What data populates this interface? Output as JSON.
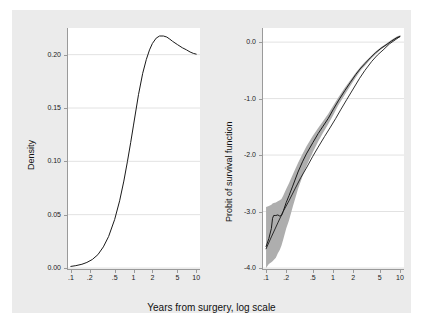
{
  "figure": {
    "background_color": "#ebebeb",
    "plot_background_color": "#ffffff",
    "axis_color": "#9a9a9a",
    "line_color": "#1a1a1a",
    "ci_band_color": "#aeaeae",
    "shared_xlabel": "Years from surgery, log scale"
  },
  "chart_data": [
    {
      "type": "line",
      "panel": "left",
      "title": "",
      "xlabel": "Years from surgery, log scale",
      "ylabel": "Density",
      "xscale": "log",
      "xlim": [
        0.09,
        11.5
      ],
      "ylim": [
        0.0,
        0.225
      ],
      "xticks": [
        0.1,
        0.2,
        0.5,
        1,
        2,
        5,
        10
      ],
      "xticklabels": [
        ".1",
        ".2",
        ".5",
        "1",
        "2",
        "5",
        "10"
      ],
      "yticks": [
        0.0,
        0.05,
        0.1,
        0.15,
        0.2
      ],
      "yticklabels": [
        "0.00",
        "0.05",
        "0.10",
        "0.15",
        "0.20"
      ],
      "grid": "horizontal",
      "legend": "none",
      "series": [
        {
          "name": "Density of log time from surgery",
          "x": [
            0.1,
            0.12,
            0.15,
            0.18,
            0.22,
            0.27,
            0.33,
            0.4,
            0.5,
            0.6,
            0.7,
            0.8,
            0.9,
            1.0,
            1.2,
            1.4,
            1.6,
            1.8,
            2.0,
            2.3,
            2.6,
            3.0,
            3.4,
            3.8,
            4.2,
            5.0,
            6.0,
            7.0,
            8.0,
            9.0,
            10.0
          ],
          "y": [
            0.0015,
            0.0022,
            0.0035,
            0.0052,
            0.008,
            0.0125,
            0.0198,
            0.0295,
            0.0455,
            0.063,
            0.0815,
            0.1,
            0.1175,
            0.134,
            0.1625,
            0.1825,
            0.1955,
            0.2045,
            0.2105,
            0.2155,
            0.2175,
            0.2175,
            0.2165,
            0.2145,
            0.2125,
            0.2095,
            0.2065,
            0.2045,
            0.2025,
            0.2012,
            0.2005
          ]
        }
      ]
    },
    {
      "type": "line",
      "panel": "right",
      "title": "",
      "xlabel": "Years from surgery, log scale",
      "ylabel": "Probit of survival function",
      "xscale": "log",
      "xlim": [
        0.09,
        11.5
      ],
      "ylim": [
        -4.0,
        0.25
      ],
      "xticks": [
        0.1,
        0.2,
        0.5,
        1,
        2,
        5,
        10
      ],
      "xticklabels": [
        ".1",
        ".2",
        ".5",
        "1",
        "2",
        "5",
        "10"
      ],
      "yticks": [
        0.0,
        -1.0,
        -2.0,
        -3.0,
        -4.0
      ],
      "yticklabels": [
        "0.0",
        "-1.0",
        "-2.0",
        "-3.0",
        "-4.0"
      ],
      "grid": "horizontal",
      "legend": "none",
      "series": [
        {
          "name": "Probit of empirical survival function",
          "style": "step",
          "x": [
            0.1,
            0.11,
            0.12,
            0.125,
            0.13,
            0.14,
            0.15,
            0.16,
            0.17,
            0.18,
            0.2,
            0.22,
            0.25,
            0.3,
            0.35,
            0.4,
            0.5,
            0.6,
            0.7,
            0.85,
            1.0,
            1.2,
            1.5,
            1.8,
            2.2,
            2.6,
            3.0,
            3.6,
            4.3,
            5.2,
            6.2,
            7.5,
            9.0,
            10.0
          ],
          "y": [
            -3.62,
            -3.48,
            -3.3,
            -3.12,
            -3.07,
            -3.07,
            -3.06,
            -3.08,
            -3.07,
            -3.0,
            -2.84,
            -2.72,
            -2.55,
            -2.3,
            -2.12,
            -1.98,
            -1.78,
            -1.62,
            -1.5,
            -1.35,
            -1.2,
            -1.04,
            -0.86,
            -0.72,
            -0.57,
            -0.46,
            -0.38,
            -0.28,
            -0.19,
            -0.11,
            -0.05,
            0.02,
            0.08,
            0.1
          ]
        },
        {
          "name": "Fitted probit line",
          "style": "smooth",
          "x": [
            0.1,
            0.12,
            0.15,
            0.18,
            0.22,
            0.27,
            0.33,
            0.4,
            0.5,
            0.6,
            0.75,
            0.9,
            1.1,
            1.3,
            1.6,
            2.0,
            2.5,
            3.0,
            3.8,
            4.6,
            5.6,
            7.0,
            8.5,
            10.0
          ],
          "y": [
            -3.66,
            -3.45,
            -3.2,
            -3.0,
            -2.81,
            -2.6,
            -2.4,
            -2.23,
            -2.02,
            -1.86,
            -1.67,
            -1.52,
            -1.35,
            -1.2,
            -1.02,
            -0.83,
            -0.64,
            -0.5,
            -0.34,
            -0.23,
            -0.14,
            -0.03,
            0.04,
            0.1
          ]
        },
        {
          "name": "95% confidence band (lower)",
          "style": "band-lower",
          "x": [
            0.1,
            0.11,
            0.12,
            0.125,
            0.13,
            0.14,
            0.15,
            0.16,
            0.17,
            0.18,
            0.2,
            0.22,
            0.25,
            0.3,
            0.35,
            0.4,
            0.5,
            0.6,
            0.7,
            0.85,
            1.0,
            1.2,
            1.5,
            1.8,
            2.2,
            2.6,
            3.0,
            3.6,
            4.3,
            5.2,
            6.2,
            7.5,
            9.0,
            10.0
          ],
          "y": [
            -4.0,
            -3.93,
            -3.9,
            -3.88,
            -3.86,
            -3.82,
            -3.74,
            -3.68,
            -3.6,
            -3.5,
            -3.3,
            -3.16,
            -2.92,
            -2.6,
            -2.38,
            -2.2,
            -1.95,
            -1.76,
            -1.62,
            -1.45,
            -1.3,
            -1.12,
            -0.93,
            -0.78,
            -0.62,
            -0.5,
            -0.42,
            -0.31,
            -0.22,
            -0.13,
            -0.07,
            0.0,
            0.06,
            0.08
          ]
        },
        {
          "name": "95% confidence band (upper)",
          "style": "band-upper",
          "x": [
            0.1,
            0.11,
            0.12,
            0.125,
            0.13,
            0.14,
            0.15,
            0.16,
            0.17,
            0.18,
            0.2,
            0.22,
            0.25,
            0.3,
            0.35,
            0.4,
            0.5,
            0.6,
            0.7,
            0.85,
            1.0,
            1.2,
            1.5,
            1.8,
            2.2,
            2.6,
            3.0,
            3.6,
            4.3,
            5.2,
            6.2,
            7.5,
            9.0,
            10.0
          ],
          "y": [
            -2.92,
            -2.9,
            -2.88,
            -2.86,
            -2.85,
            -2.84,
            -2.82,
            -2.8,
            -2.78,
            -2.72,
            -2.6,
            -2.5,
            -2.35,
            -2.14,
            -1.98,
            -1.85,
            -1.66,
            -1.52,
            -1.41,
            -1.27,
            -1.13,
            -0.98,
            -0.81,
            -0.68,
            -0.54,
            -0.43,
            -0.35,
            -0.26,
            -0.17,
            -0.09,
            -0.03,
            0.04,
            0.1,
            0.12
          ]
        }
      ]
    }
  ]
}
